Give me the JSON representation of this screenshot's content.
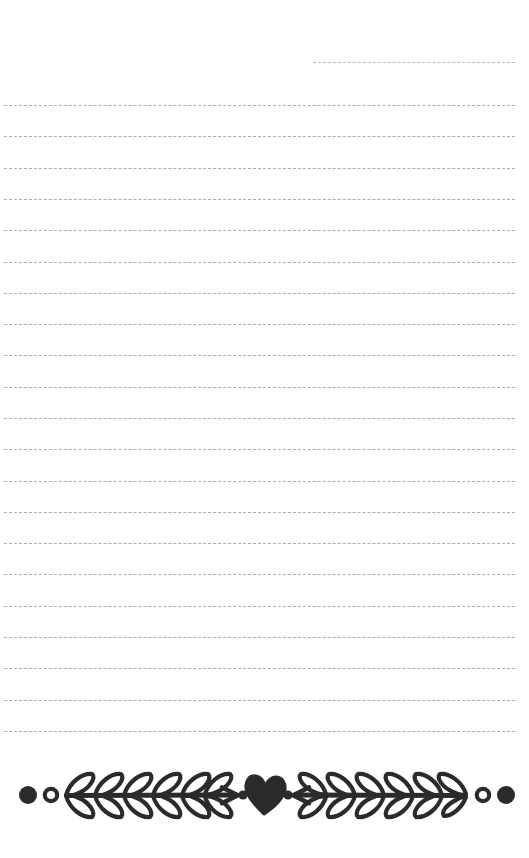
{
  "page": {
    "width": 529,
    "height": 858,
    "background_color": "#ffffff",
    "type": "lined-journal-page"
  },
  "rules": {
    "style": "dashed",
    "color": "#adadad",
    "thickness_px": 1.6,
    "dash_length_px": 9,
    "dash_gap_px": 4,
    "left_x": 4,
    "right_x": 515,
    "spacing_px": 31.3,
    "count": 21,
    "partial_first_line": {
      "y": 62,
      "left_x": 313,
      "right_x": 515,
      "note": "shorter top line indented from the right"
    },
    "line_y_positions": [
      105,
      136,
      168,
      199,
      230,
      262,
      293,
      324,
      355,
      387,
      418,
      449,
      481,
      512,
      543,
      574,
      606,
      637,
      668,
      700,
      731
    ]
  },
  "divider": {
    "name": "laurel-heart-divider",
    "ink_color": "#2b2b2b",
    "center_y": 795,
    "center_x": 258,
    "stem_left_x": 56,
    "stem_right_x": 466,
    "elements": [
      "filled-dot-left",
      "hollow-circle-left",
      "laurel-branch-left",
      "small-dot-left",
      "heart",
      "small-dot-right",
      "laurel-branch-right",
      "hollow-circle-right",
      "filled-dot-right"
    ],
    "leaf_pairs_per_branch": 6,
    "heart": {
      "label": "heart",
      "filled": true,
      "width_px": 40,
      "height_px": 38
    },
    "dots": {
      "filled_radius_px": 9,
      "hollow_outer_radius_px": 6.5,
      "hollow_inner_radius_px": 3.2,
      "small_radius_px": 4.5
    }
  }
}
